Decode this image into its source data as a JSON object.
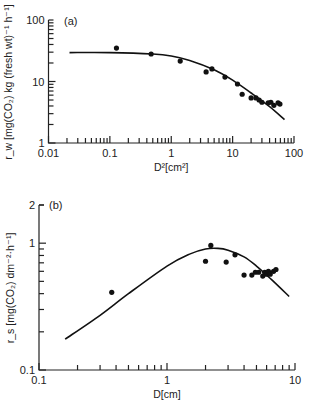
{
  "chart_data": [
    {
      "type": "scatter",
      "panel_label": "(a)",
      "title": "",
      "xlabel": "D²[cm²]",
      "ylabel": "r_w [mg(CO₂) kg (fresh wt)⁻¹ h⁻¹]",
      "xscale": "log",
      "yscale": "log",
      "xlim": [
        0.01,
        100
      ],
      "ylim": [
        1,
        100
      ],
      "xticks": [
        "0.01",
        "0.1",
        "1",
        "10",
        "100"
      ],
      "yticks": [
        "1",
        "10",
        "100"
      ],
      "grid": false,
      "series": [
        {
          "name": "observed",
          "kind": "points",
          "x": [
            0.128,
            0.47,
            1.4,
            3.7,
            4.6,
            7.5,
            12,
            14.3,
            20,
            24,
            27,
            30,
            38,
            42,
            47,
            55,
            59
          ],
          "y": [
            35,
            28,
            21.5,
            14.3,
            16,
            11.8,
            9.1,
            6.2,
            5.4,
            5.4,
            5.0,
            4.6,
            4.5,
            4.6,
            4.1,
            4.5,
            4.3
          ]
        },
        {
          "name": "fitted curve",
          "kind": "line",
          "x": [
            0.022,
            0.1,
            0.5,
            1,
            2,
            5,
            10,
            20,
            40,
            70
          ],
          "y": [
            29.5,
            29.5,
            28,
            26,
            22,
            15.5,
            10.5,
            6.5,
            3.9,
            2.4
          ]
        }
      ]
    },
    {
      "type": "scatter",
      "panel_label": "(b)",
      "title": "",
      "xlabel": "D[cm]",
      "ylabel": "r_s [mg(CO₂) dm⁻²·h⁻¹]",
      "xscale": "log",
      "yscale": "log",
      "xlim": [
        0.1,
        10
      ],
      "ylim": [
        0.1,
        2
      ],
      "xticks": [
        "0.1",
        "1",
        "10"
      ],
      "yticks": [
        "0.1",
        "1",
        "2"
      ],
      "grid": false,
      "series": [
        {
          "name": "observed",
          "kind": "points",
          "x": [
            0.37,
            2.0,
            2.2,
            2.9,
            3.4,
            4.0,
            4.6,
            4.9,
            5.2,
            5.6,
            5.8,
            6.0,
            6.2,
            6.4,
            6.8,
            7.1
          ],
          "y": [
            0.41,
            0.72,
            0.96,
            0.71,
            0.81,
            0.56,
            0.56,
            0.59,
            0.59,
            0.55,
            0.59,
            0.57,
            0.6,
            0.57,
            0.6,
            0.62
          ]
        },
        {
          "name": "fitted curve",
          "kind": "line",
          "x": [
            0.16,
            0.3,
            0.5,
            1.0,
            1.5,
            2.0,
            2.5,
            3.0,
            4.0,
            5.0,
            6.5,
            9.0
          ],
          "y": [
            0.175,
            0.27,
            0.4,
            0.66,
            0.82,
            0.9,
            0.91,
            0.88,
            0.78,
            0.66,
            0.52,
            0.38
          ]
        }
      ]
    }
  ]
}
